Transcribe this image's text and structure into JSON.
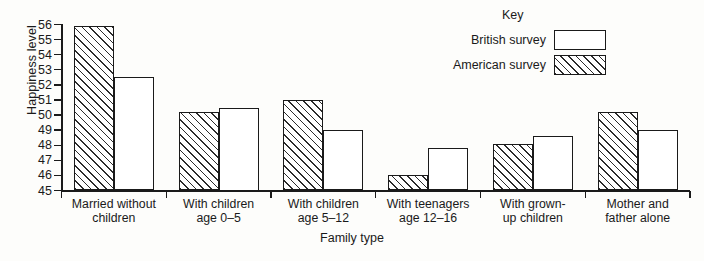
{
  "chart_data": {
    "type": "bar",
    "title": "",
    "xlabel": "Family type",
    "ylabel": "Happiness level",
    "ylim": [
      45,
      56
    ],
    "yticks": [
      45,
      46,
      47,
      48,
      49,
      50,
      51,
      52,
      53,
      54,
      55,
      56
    ],
    "grid": false,
    "legend_position": "top-right",
    "legend_title": "Key",
    "categories": [
      "Married without\nchildren",
      "With children\nage 0–5",
      "With children\nage 5–12",
      "With teenagers\nage 12–16",
      "With grown-\nup children",
      "Mother and\nfather alone"
    ],
    "series": [
      {
        "name": "American survey",
        "fill": "diagonal-hatch",
        "values": [
          55.9,
          50.2,
          51.0,
          46.0,
          48.1,
          50.2
        ]
      },
      {
        "name": "British survey",
        "fill": "white",
        "values": [
          52.5,
          50.5,
          49.0,
          47.8,
          48.6,
          49.0
        ]
      }
    ]
  },
  "legend": {
    "title": "Key",
    "entries": [
      {
        "label": "British survey",
        "swatch": "white"
      },
      {
        "label": "American survey",
        "swatch": "diagonal-hatch"
      }
    ]
  },
  "axes": {
    "y_title": "Happiness level",
    "x_title": "Family type"
  },
  "colors": {
    "ink": "#1a1a1a",
    "background": "#fdfdfb",
    "hatch": "#2b2b2b",
    "fill": "#ffffff"
  }
}
